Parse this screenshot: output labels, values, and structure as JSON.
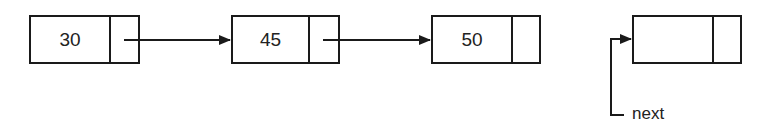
{
  "diagram": {
    "type": "linked-list",
    "nodes": [
      {
        "value": "30",
        "x": 29,
        "width": 111,
        "data_width": 79
      },
      {
        "value": "45",
        "x": 231,
        "width": 109,
        "data_width": 77
      },
      {
        "value": "50",
        "x": 431,
        "width": 110,
        "data_width": 80
      },
      {
        "value": "",
        "x": 632,
        "width": 110,
        "data_width": 80
      }
    ],
    "edges": [
      {
        "from": 0,
        "to": 1
      },
      {
        "from": 1,
        "to": 2
      }
    ],
    "pointer_label": "next",
    "line_color": "#1a1a1a"
  }
}
